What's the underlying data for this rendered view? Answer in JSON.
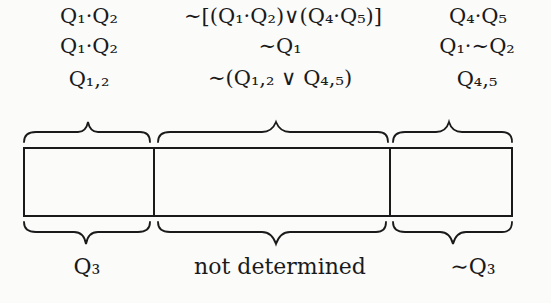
{
  "diagram": {
    "top_labels": [
      {
        "column": "left",
        "lines": [
          "Q₁·Q₂",
          "Q₁·Q₂",
          "Q₁,₂"
        ]
      },
      {
        "column": "middle",
        "lines": [
          "∼[(Q₁·Q₂)∨(Q₄·Q₅)]",
          "∼Q₁",
          "∼(Q₁,₂ ∨ Q₄,₅)"
        ]
      },
      {
        "column": "right",
        "lines": [
          "Q₄·Q₅",
          "Q₁·∼Q₂",
          "Q₄,₅"
        ]
      }
    ],
    "bottom_labels": {
      "left": "Q₃",
      "middle": "not determined",
      "right": "∼Q₃"
    },
    "box": {
      "segments": [
        "left",
        "middle",
        "right"
      ],
      "stroke_color": "#1a1a1a"
    }
  }
}
